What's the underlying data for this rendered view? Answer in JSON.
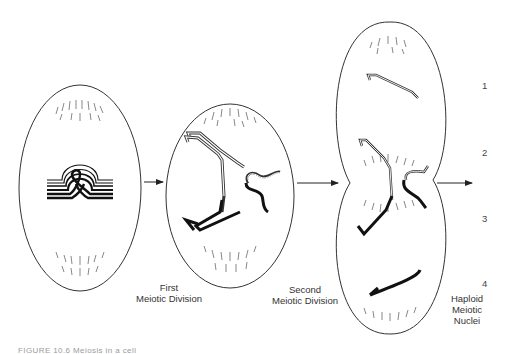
{
  "figure": {
    "stages": [
      {
        "id": "stage-1",
        "description": "Cell with paired homologous chromosomes (chiasma loop)"
      },
      {
        "id": "stage-2",
        "description": "Cell after first meiotic division, chromatids separating"
      },
      {
        "id": "stage-3",
        "description": "Dividing cell after second meiotic division, four chromatids"
      }
    ],
    "transitions": [
      {
        "label_line1": "First",
        "label_line2": "Meiotic Division"
      },
      {
        "label_line1": "Second",
        "label_line2": "Meiotic Division"
      }
    ],
    "result_label": {
      "line1": "Haploid",
      "line2": "Meiotic",
      "line3": "Nuclei"
    },
    "nucleus_numbers": [
      "1",
      "2",
      "3",
      "4"
    ],
    "caption": "FIGURE 10.6  Meiosis in a cell"
  },
  "colors": {
    "line": "#333333",
    "chromosome": "#111111",
    "spindle": "#555555"
  }
}
